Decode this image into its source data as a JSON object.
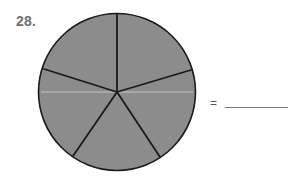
{
  "problem": {
    "number": "28.",
    "equals": "=",
    "answer_blank": ""
  },
  "figure": {
    "shape": "circle",
    "parts": 5,
    "shaded_parts": 5,
    "fill_color": "#8c8c8c",
    "stroke_color": "#1a1a1a"
  }
}
